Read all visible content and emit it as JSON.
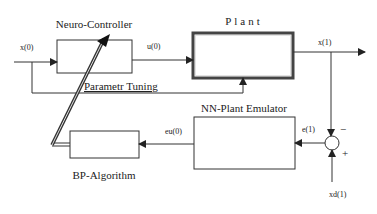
{
  "blocks": {
    "neuro_controller": "Neuro-Controller",
    "plant": "Plant",
    "nn_plant_emulator": "NN-Plant Emulator",
    "bp_algorithm": "BP-Algorithm"
  },
  "signals": {
    "input": "x(0)",
    "control": "u(0)",
    "output": "x(1)",
    "error": "e(1)",
    "emulator_error": "eu(0)",
    "desired": "xd(1)",
    "parameter_tuning": "Parametr Tuning"
  },
  "junction": {
    "minus": "−",
    "plus": "+"
  },
  "colors": {
    "line": "#333333",
    "background": "#ffffff"
  }
}
